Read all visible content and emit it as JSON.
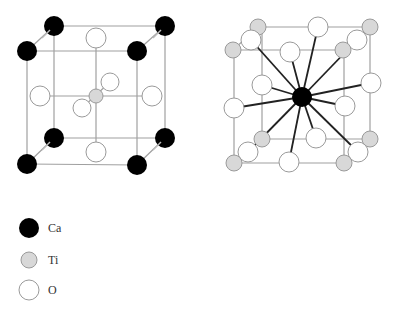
{
  "colors": {
    "Ca": "#000000",
    "Ti": "#d8d8d8",
    "O": "#ffffff",
    "atom_stroke": "#9a9a9a",
    "cell_edge": "#a0a0a0",
    "bond": "#222222"
  },
  "legend": [
    {
      "species": "Ca",
      "label": "Ca"
    },
    {
      "species": "Ti",
      "label": "Ti"
    },
    {
      "species": "O",
      "label": "O"
    }
  ],
  "views": [
    {
      "name": "ti-centered-cell",
      "corner_species": "Ca",
      "center_species": "Ti",
      "face_species": "O",
      "description": "Ti at body center, Ca at corners, O at face centers"
    },
    {
      "name": "ca-centered-cell",
      "corner_species": "Ti",
      "center_species": "Ca",
      "edge_species": "O",
      "coordination": 12,
      "description": "Ca at body center with 12 O neighbors, Ti at corners, O at edge midpoints"
    }
  ]
}
